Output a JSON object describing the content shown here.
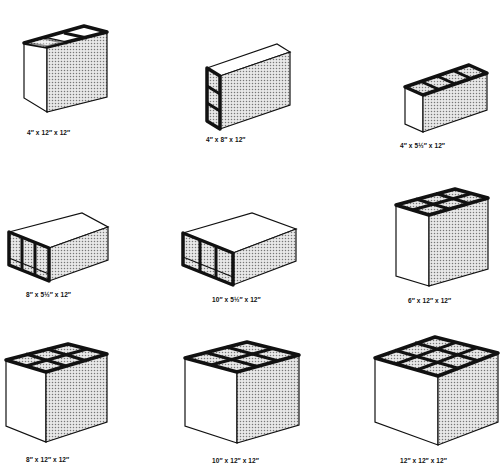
{
  "colors": {
    "line": "#111111",
    "stipple_bg": "#e6e6e6",
    "stipple_dot": "#8a8a8a",
    "face": "#ffffff"
  },
  "blocks": [
    {
      "id": "b1",
      "label": "4″ x 12″ x 12″",
      "cells": "3 cells, top-open"
    },
    {
      "id": "b2",
      "label": "4″ x 8″ x 12″",
      "cells": "3 cells, end-open vertical"
    },
    {
      "id": "b3",
      "label": "4″ x 5½″ x 12″",
      "cells": "3 cells, top-open"
    },
    {
      "id": "b4",
      "label": "8″ x 5½″ x 12″",
      "cells": "3 cells, end-open"
    },
    {
      "id": "b5",
      "label": "10″ x 5½″ x 12″",
      "cells": "3 cells, end-open"
    },
    {
      "id": "b6",
      "label": "6″ x 12″ x 12″",
      "cells": "6 cells, top-open"
    },
    {
      "id": "b7",
      "label": "8″ x 12″ x 12″",
      "cells": "6 cells, top-open"
    },
    {
      "id": "b8",
      "label": "10″ x 12″ x 12″",
      "cells": "6 cells, top-open"
    },
    {
      "id": "b9",
      "label": "12″ x 12″ x 12″",
      "cells": "9 cells, top-open"
    }
  ]
}
